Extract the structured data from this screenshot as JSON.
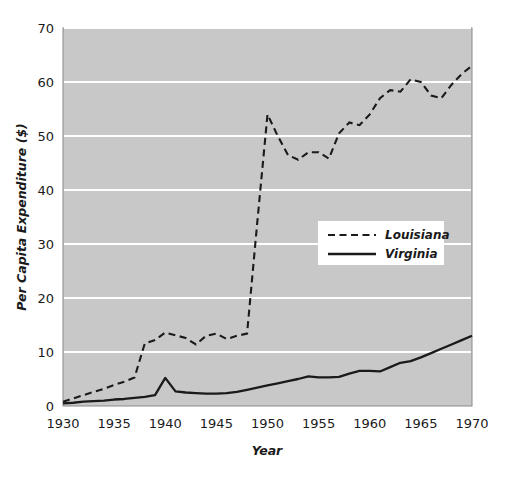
{
  "chart_data": {
    "type": "line",
    "title": "",
    "xlabel": "Year",
    "ylabel": "Per Capita Expenditure ($)",
    "xlim": [
      1930,
      1970
    ],
    "ylim": [
      0,
      70
    ],
    "xticks": [
      "1930",
      "1935",
      "1940",
      "1945",
      "1950",
      "1955",
      "1960",
      "1965",
      "1970"
    ],
    "yticks": [
      "0",
      "10",
      "20",
      "30",
      "40",
      "50",
      "60",
      "70"
    ],
    "grid": "horizontal-white-gridlines",
    "legend_position": "center-right-inside",
    "plot_background": "#c8c8c8",
    "gridline_color": "#ffffff",
    "series": [
      {
        "name": "Louisiana",
        "style": "dashed",
        "color": "#1a1a1a",
        "x": [
          1930,
          1931,
          1932,
          1933,
          1934,
          1935,
          1936,
          1937,
          1938,
          1939,
          1940,
          1941,
          1942,
          1943,
          1944,
          1945,
          1946,
          1947,
          1948,
          1949,
          1950,
          1951,
          1952,
          1953,
          1954,
          1955,
          1956,
          1957,
          1958,
          1959,
          1960,
          1961,
          1962,
          1963,
          1964,
          1965,
          1966,
          1967,
          1968,
          1969,
          1970
        ],
        "values": [
          0.8,
          1.4,
          2.0,
          2.6,
          3.2,
          3.9,
          4.5,
          5.3,
          11.6,
          12.2,
          13.6,
          13.1,
          12.6,
          11.4,
          13.0,
          13.4,
          12.4,
          13.0,
          13.4,
          34.0,
          54.0,
          50.0,
          46.5,
          45.6,
          47.0,
          47.0,
          45.8,
          50.5,
          52.5,
          52.0,
          54.0,
          57.0,
          58.5,
          58.2,
          60.5,
          60.0,
          57.5,
          57.0,
          59.5,
          61.5,
          63.0
        ]
      },
      {
        "name": "Virginia",
        "style": "solid",
        "color": "#1a1a1a",
        "x": [
          1930,
          1931,
          1932,
          1933,
          1934,
          1935,
          1936,
          1937,
          1938,
          1939,
          1940,
          1941,
          1942,
          1943,
          1944,
          1945,
          1946,
          1947,
          1948,
          1949,
          1950,
          1951,
          1952,
          1953,
          1954,
          1955,
          1956,
          1957,
          1958,
          1959,
          1960,
          1961,
          1962,
          1963,
          1964,
          1965,
          1966,
          1967,
          1968,
          1969,
          1970
        ],
        "values": [
          0.5,
          0.6,
          0.8,
          0.9,
          1.0,
          1.2,
          1.3,
          1.5,
          1.7,
          2.0,
          5.2,
          2.7,
          2.5,
          2.4,
          2.3,
          2.3,
          2.4,
          2.6,
          3.0,
          3.4,
          3.8,
          4.2,
          4.6,
          5.0,
          5.5,
          5.3,
          5.3,
          5.4,
          6.0,
          6.5,
          6.5,
          6.4,
          7.2,
          8.0,
          8.3,
          9.0,
          9.8,
          10.6,
          11.4,
          12.2,
          13.0
        ]
      }
    ]
  },
  "legend": {
    "items": [
      {
        "label": "Louisiana",
        "style": "dashed"
      },
      {
        "label": "Virginia",
        "style": "solid"
      }
    ]
  },
  "axes": {
    "x_title": "Year",
    "y_title": "Per Capita Expenditure ($)"
  }
}
